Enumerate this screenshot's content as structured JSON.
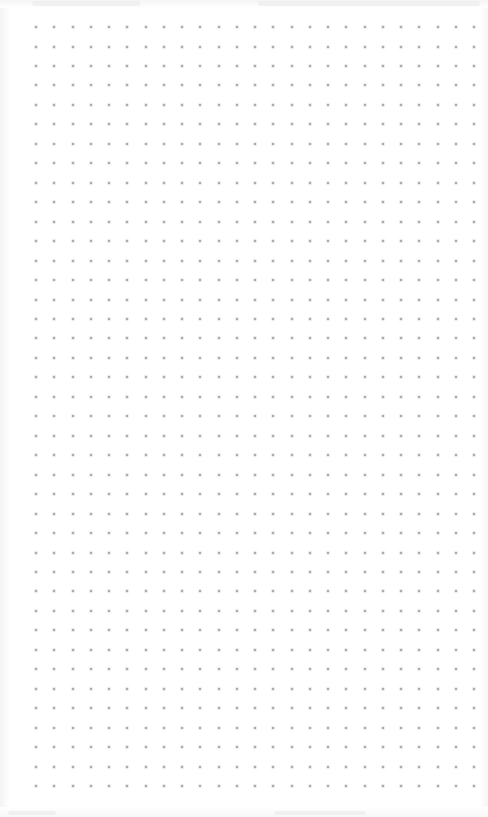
{
  "canvas": {
    "type": "dot-grid",
    "columns": 25,
    "rows": 40,
    "dot_color": "#9a9a9a",
    "background_color": "#ffffff"
  },
  "header": {
    "text_legible": false
  },
  "footer": {
    "text_legible": false
  }
}
